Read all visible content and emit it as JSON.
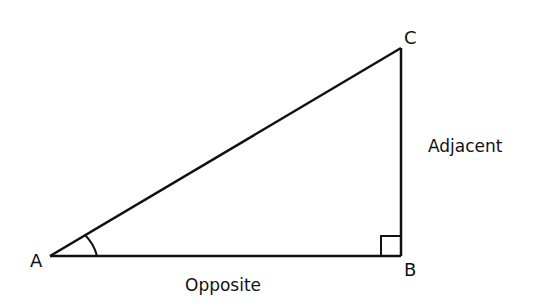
{
  "diagram": {
    "type": "right-triangle",
    "vertices": {
      "A": {
        "label": "A",
        "x": 50,
        "y": 256
      },
      "B": {
        "label": "B",
        "x": 401,
        "y": 256
      },
      "C": {
        "label": "C",
        "x": 401,
        "y": 48
      }
    },
    "sides": {
      "base": {
        "label": "Opposite"
      },
      "vertical": {
        "label": "Adjacent"
      }
    },
    "markers": {
      "angle_at": "A",
      "right_angle_at": "B"
    },
    "colors": {
      "stroke": "#111111",
      "background": "#ffffff"
    }
  }
}
